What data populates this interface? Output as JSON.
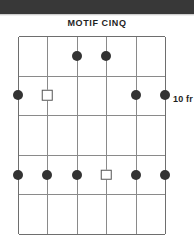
{
  "document": {
    "title": "MOTIF CINQ"
  },
  "top_band": {
    "color": "#383838"
  },
  "diagram": {
    "kind": "guitar-chord-fretboard",
    "string_count": 6,
    "fret_count": 5,
    "position_label": "10 fr",
    "grid_color": "#8a8a8a",
    "border_color": "#6e6e6e",
    "dot_color": "#333333",
    "square_fill": "#ffffff",
    "square_stroke": "#555555",
    "strings": [
      "1",
      "2",
      "3",
      "4",
      "5",
      "6"
    ],
    "frets": [
      "1",
      "2",
      "3",
      "4",
      "5"
    ],
    "markers": [
      {
        "string": 3,
        "fret": 1,
        "shape": "dot",
        "name": "marker-s3-f1"
      },
      {
        "string": 4,
        "fret": 1,
        "shape": "dot",
        "name": "marker-s4-f1"
      },
      {
        "string": 1,
        "fret": 2,
        "shape": "dot",
        "name": "marker-s1-f2"
      },
      {
        "string": 2,
        "fret": 2,
        "shape": "square",
        "name": "marker-s2-f2"
      },
      {
        "string": 5,
        "fret": 2,
        "shape": "dot",
        "name": "marker-s5-f2"
      },
      {
        "string": 6,
        "fret": 2,
        "shape": "dot",
        "name": "marker-s6-f2"
      },
      {
        "string": 1,
        "fret": 4,
        "shape": "dot",
        "name": "marker-s1-f4"
      },
      {
        "string": 2,
        "fret": 4,
        "shape": "dot",
        "name": "marker-s2-f4"
      },
      {
        "string": 3,
        "fret": 4,
        "shape": "dot",
        "name": "marker-s3-f4"
      },
      {
        "string": 4,
        "fret": 4,
        "shape": "square",
        "name": "marker-s4-f4"
      },
      {
        "string": 5,
        "fret": 4,
        "shape": "dot",
        "name": "marker-s5-f4"
      },
      {
        "string": 6,
        "fret": 4,
        "shape": "dot",
        "name": "marker-s6-f4"
      }
    ],
    "geometry": {
      "width": 147,
      "height": 198,
      "string_spacing": 29.4,
      "fret_spacing": 39.6,
      "dot_radius": 5.0,
      "square_size": 8.5
    }
  }
}
